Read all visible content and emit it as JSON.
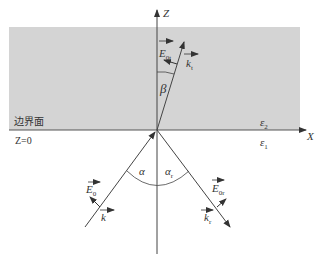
{
  "diagram": {
    "medium_color": "#d4d4d4",
    "line_color": "#444444",
    "labels": {
      "z_axis": "Z",
      "x_axis": "X",
      "boundary": "边界面",
      "z0": "Z=0",
      "eps2": "ε",
      "eps2_sub": "2",
      "eps1": "ε",
      "eps1_sub": "1",
      "beta": "β",
      "alpha": "α",
      "alpha_r": "α",
      "alpha_r_sub": "r",
      "E_incident": "E",
      "E_incident_sub": "0",
      "k_incident": "k",
      "E_reflected": "E",
      "E_reflected_sub": "0r",
      "k_reflected": "k",
      "k_reflected_sub": "r",
      "E_transmitted": "E",
      "E_transmitted_sub": "0t",
      "k_transmitted": "k",
      "k_transmitted_sub": "t"
    }
  }
}
